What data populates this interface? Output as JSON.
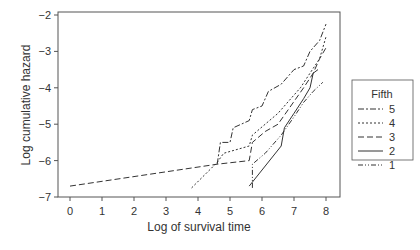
{
  "chart_data": {
    "type": "line",
    "title": "",
    "xlabel": "Log of survival time",
    "ylabel": "Log cumulative hazard",
    "xlim": [
      -0.4,
      8.4
    ],
    "ylim": [
      -7.1,
      -1.9
    ],
    "xticks": [
      0,
      1,
      2,
      3,
      4,
      5,
      6,
      7,
      8
    ],
    "yticks": [
      -7,
      -6,
      -5,
      -4,
      -3,
      -2
    ],
    "grid": false,
    "legend": {
      "title": "Fifth",
      "position": "right",
      "entries": [
        "5",
        "4",
        "3",
        "2",
        "1"
      ]
    },
    "series": [
      {
        "name": "5",
        "dash": "6,2,2,2",
        "points": [
          [
            4.6,
            -6.1
          ],
          [
            4.7,
            -5.5
          ],
          [
            5.0,
            -5.5
          ],
          [
            5.1,
            -5.1
          ],
          [
            5.6,
            -4.9
          ],
          [
            5.7,
            -4.6
          ],
          [
            6.0,
            -4.5
          ],
          [
            6.2,
            -4.1
          ],
          [
            6.6,
            -3.9
          ],
          [
            7.0,
            -3.5
          ],
          [
            7.3,
            -3.4
          ],
          [
            7.5,
            -3.0
          ],
          [
            7.8,
            -2.7
          ],
          [
            8.0,
            -2.25
          ]
        ]
      },
      {
        "name": "4",
        "dash": "2,2",
        "points": [
          [
            3.8,
            -6.75
          ],
          [
            4.6,
            -6.05
          ],
          [
            4.8,
            -5.8
          ],
          [
            5.6,
            -5.6
          ],
          [
            5.7,
            -5.3
          ],
          [
            6.1,
            -5.0
          ],
          [
            6.5,
            -4.7
          ],
          [
            6.9,
            -4.3
          ],
          [
            7.2,
            -4.0
          ],
          [
            7.5,
            -3.6
          ],
          [
            7.8,
            -3.2
          ],
          [
            8.0,
            -2.6
          ]
        ]
      },
      {
        "name": "3",
        "dash": "6,3",
        "points": [
          [
            0.0,
            -6.7
          ],
          [
            4.6,
            -6.1
          ],
          [
            5.6,
            -6.0
          ],
          [
            5.7,
            -5.5
          ],
          [
            6.1,
            -5.2
          ],
          [
            6.5,
            -5.0
          ],
          [
            6.9,
            -4.5
          ],
          [
            7.3,
            -4.0
          ],
          [
            7.6,
            -3.6
          ],
          [
            7.8,
            -3.2
          ],
          [
            8.0,
            -2.9
          ]
        ]
      },
      {
        "name": "2",
        "dash": "",
        "points": [
          [
            5.6,
            -6.7
          ],
          [
            6.6,
            -5.6
          ],
          [
            6.7,
            -5.1
          ],
          [
            7.0,
            -4.7
          ],
          [
            7.3,
            -4.3
          ],
          [
            7.5,
            -4.0
          ],
          [
            7.6,
            -3.6
          ],
          [
            7.75,
            -3.5
          ]
        ]
      },
      {
        "name": "1",
        "dash": "5,2,1,2,1,2",
        "points": [
          [
            5.7,
            -6.75
          ],
          [
            5.7,
            -6.1
          ],
          [
            6.1,
            -5.8
          ],
          [
            6.6,
            -5.3
          ],
          [
            7.0,
            -4.8
          ],
          [
            7.3,
            -4.4
          ],
          [
            7.6,
            -4.1
          ],
          [
            7.9,
            -3.85
          ]
        ]
      }
    ]
  }
}
